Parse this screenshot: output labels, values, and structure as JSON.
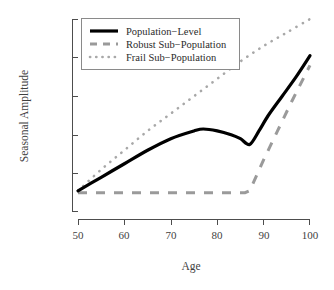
{
  "chart_data": {
    "type": "line",
    "title": "",
    "xlabel": "Age",
    "ylabel": "Seasonal Amplitude",
    "xlim": [
      50,
      100
    ],
    "ylim": [
      0,
      100
    ],
    "xticks": [
      50,
      60,
      70,
      80,
      90,
      100
    ],
    "xtick_labels": [
      "50",
      "60",
      "70",
      "80",
      "90",
      "100"
    ],
    "yticks": [
      0,
      20,
      40,
      60,
      80,
      100
    ],
    "ytick_labels": [
      "",
      "",
      "",
      "",
      "",
      ""
    ],
    "grid": false,
    "legend_position": "top-left",
    "series": [
      {
        "name": "Population-Level",
        "style": "solid",
        "color": "#000000",
        "x": [
          50,
          55,
          60,
          65,
          70,
          75,
          77,
          80,
          83,
          85,
          87,
          89,
          91,
          94,
          97,
          100
        ],
        "y": [
          11,
          18,
          25,
          32,
          38,
          42,
          43,
          42,
          40,
          38,
          35,
          42,
          50,
          60,
          70,
          81
        ]
      },
      {
        "name": "Robust Sub-Population",
        "style": "dashed",
        "color": "#9a9a9a",
        "x": [
          50,
          60,
          70,
          80,
          86,
          87,
          90,
          93,
          96,
          100
        ],
        "y": [
          10,
          10,
          10,
          10,
          10,
          11,
          27,
          42,
          57,
          76
        ]
      },
      {
        "name": "Frail Sub-Population",
        "style": "dotted",
        "color": "#a8a8a8",
        "x": [
          50,
          55,
          60,
          65,
          70,
          75,
          80,
          85,
          90,
          95,
          100
        ],
        "y": [
          11,
          22,
          32,
          42,
          51,
          60,
          69,
          78,
          86,
          93,
          100
        ]
      }
    ]
  },
  "legend": {
    "entries": [
      {
        "label": "Population−Level",
        "key": "solid-line-key"
      },
      {
        "label": "Robust Sub−Population",
        "key": "dashed-line-key"
      },
      {
        "label": "Frail Sub−Population",
        "key": "dotted-line-key"
      }
    ]
  },
  "axes": {
    "x_title": "Age",
    "y_title": "Seasonal Amplitude",
    "x_tick_labels": [
      "50",
      "60",
      "70",
      "80",
      "90",
      "100"
    ]
  }
}
